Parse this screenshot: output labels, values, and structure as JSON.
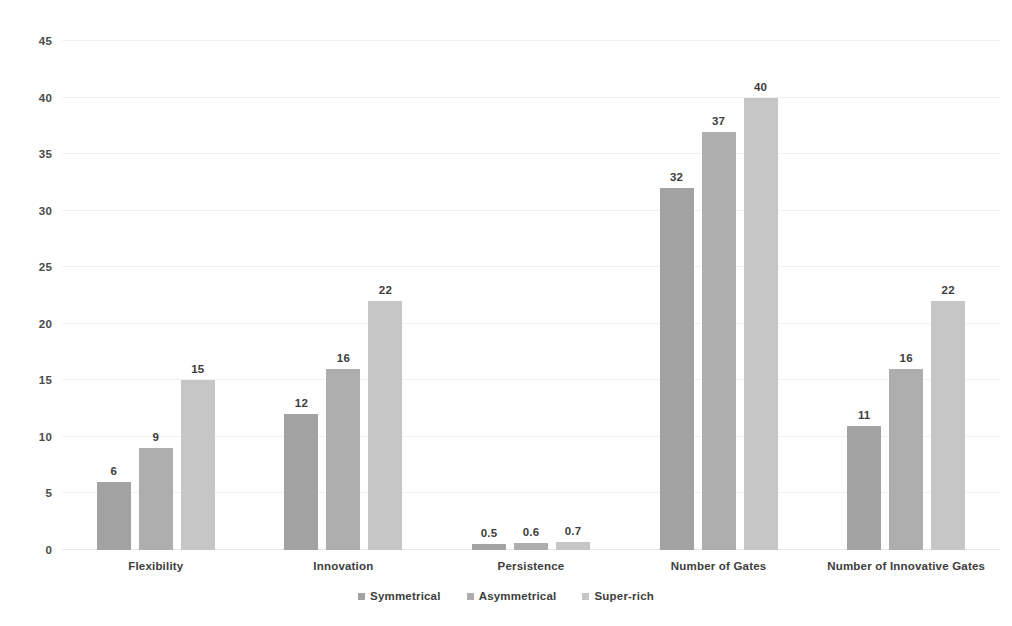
{
  "chart_data": {
    "type": "bar",
    "title": "",
    "subtitle": "",
    "xlabel": "",
    "ylabel": "",
    "ylim": [
      0,
      45
    ],
    "yticks": [
      0,
      5,
      10,
      15,
      20,
      25,
      30,
      35,
      40,
      45
    ],
    "ytick_labels": [
      "0",
      "5",
      "10",
      "15",
      "20",
      "25",
      "30",
      "35",
      "40",
      "45"
    ],
    "grid": true,
    "grid_axis": "y",
    "legend_position": "bottom",
    "data_labels": true,
    "categories": [
      "Flexibility",
      "Innovation",
      "Persistence",
      "Number of Gates",
      "Number of Innovative Gates"
    ],
    "series": [
      {
        "name": "Symmetrical",
        "color": "#a2a2a2",
        "values": [
          6,
          12,
          0.5,
          32,
          11
        ],
        "labels": [
          "6",
          "12",
          "0.5",
          "32",
          "11"
        ]
      },
      {
        "name": "Asymmetrical",
        "color": "#aeaeae",
        "values": [
          9,
          16,
          0.6,
          37,
          16
        ],
        "labels": [
          "9",
          "16",
          "0.6",
          "37",
          "16"
        ]
      },
      {
        "name": "Super-rich",
        "color": "#c6c6c6",
        "values": [
          15,
          22,
          0.7,
          40,
          22
        ],
        "labels": [
          "15",
          "22",
          "0.7",
          "40",
          "22"
        ]
      }
    ]
  }
}
